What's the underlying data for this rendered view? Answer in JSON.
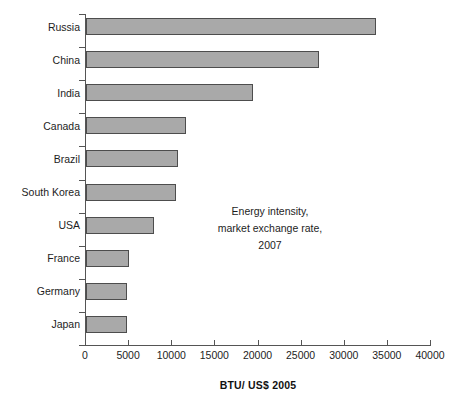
{
  "chart_data": {
    "type": "bar",
    "orientation": "horizontal",
    "title": "",
    "subtitle": "",
    "xlabel": "BTU/ US$ 2005",
    "ylabel": "",
    "xlim": [
      0,
      40000
    ],
    "xticks": [
      0,
      5000,
      10000,
      15000,
      20000,
      25000,
      30000,
      35000,
      40000
    ],
    "xtick_labels": [
      "0",
      "5000",
      "10000",
      "15000",
      "20000",
      "25000",
      "30000",
      "35000",
      "40000"
    ],
    "grid": false,
    "legend": null,
    "categories": [
      "Russia",
      "China",
      "India",
      "Canada",
      "Brazil",
      "South Korea",
      "USA",
      "France",
      "Germany",
      "Japan"
    ],
    "values": [
      33600,
      27000,
      19400,
      11600,
      10700,
      10400,
      7900,
      5000,
      4800,
      4700
    ],
    "annotations": [
      {
        "lines": [
          "Energy intensity,",
          "market exchange rate,",
          "2007"
        ]
      }
    ],
    "colors": {
      "bar_fill": "#a9a9a9",
      "bar_border": "#4d4d4d",
      "axis": "#555555",
      "text": "#1d1d1d",
      "background": "#ffffff"
    }
  },
  "annotation": {
    "line1": "Energy intensity,",
    "line2": "market exchange rate,",
    "line3": "2007"
  },
  "axis": {
    "x_title": "BTU/ US$ 2005"
  }
}
